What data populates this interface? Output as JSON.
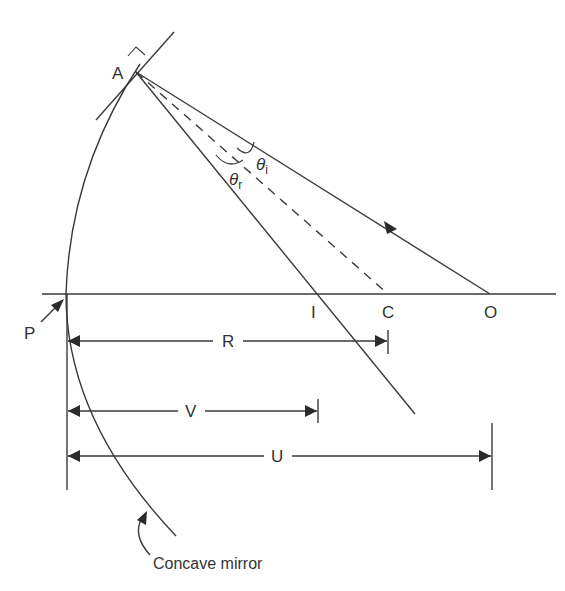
{
  "diagram": {
    "points": {
      "A": "A",
      "P": "P",
      "I": "I",
      "C": "C",
      "O": "O"
    },
    "angles": {
      "incidence": "θ",
      "incidence_sub": "i",
      "reflection": "θ",
      "reflection_sub": "r"
    },
    "dimensions": {
      "R": "R",
      "V": "V",
      "U": "U"
    },
    "mirror_label": "Concave mirror",
    "colors": {
      "line": "#3a3a3a",
      "text": "#333333",
      "background": "#ffffff"
    }
  }
}
